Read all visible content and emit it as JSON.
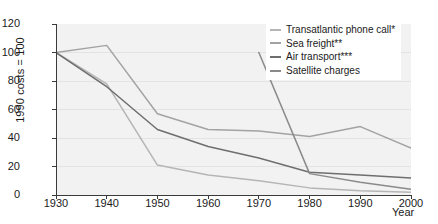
{
  "chart_data": {
    "type": "line",
    "title": "",
    "xlabel": "Year",
    "ylabel": "1990 costs = 100",
    "x": [
      1930,
      1940,
      1950,
      1960,
      1970,
      1980,
      1990,
      2000
    ],
    "xlim": [
      1930,
      2000
    ],
    "ylim": [
      0,
      120
    ],
    "xticks": [
      "1930",
      "1940",
      "1950",
      "1960",
      "1970",
      "1980",
      "1990",
      "2000"
    ],
    "yticks": [
      "0",
      "20",
      "40",
      "60",
      "80",
      "100",
      "120"
    ],
    "grid": "horizontal",
    "legend_position": "top-right",
    "series": [
      {
        "name": "Transatlantic phone call*",
        "color": "#b5b5b5",
        "x": [
          1930,
          1940,
          1950,
          1960,
          1970,
          1980,
          1990,
          2000
        ],
        "values": [
          100,
          78,
          21,
          14,
          10,
          5,
          3,
          2
        ]
      },
      {
        "name": "Sea freight**",
        "color": "#a3a3a3",
        "x": [
          1930,
          1940,
          1950,
          1960,
          1970,
          1980,
          1990,
          2000
        ],
        "values": [
          100,
          105,
          57,
          46,
          45,
          41,
          48,
          33
        ]
      },
      {
        "name": "Air transport***",
        "color": "#6e6e6e",
        "x": [
          1930,
          1940,
          1950,
          1960,
          1970,
          1980,
          1990,
          2000
        ],
        "values": [
          100,
          76,
          46,
          34,
          26,
          16,
          14,
          12
        ]
      },
      {
        "name": "Satellite charges",
        "color": "#8a8a8a",
        "x": [
          1970,
          1980,
          1990,
          2000
        ],
        "values": [
          100,
          15,
          9,
          4
        ]
      }
    ]
  },
  "legend": {
    "items": [
      {
        "label": "Transatlantic phone call*"
      },
      {
        "label": "Sea freight**"
      },
      {
        "label": "Air transport***"
      },
      {
        "label": "Satellite charges"
      }
    ]
  },
  "axes": {
    "y_title": "1990 costs = 100",
    "x_title": "Year"
  }
}
